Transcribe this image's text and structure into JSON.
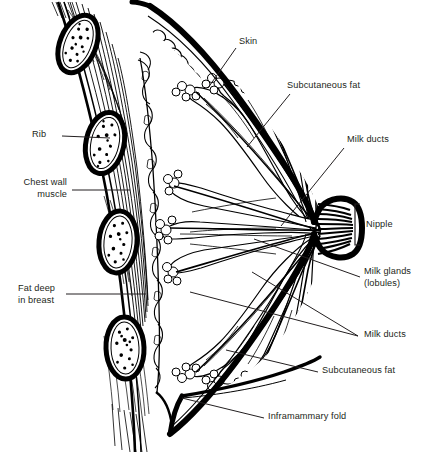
{
  "figure": {
    "type": "medical-illustration",
    "view": "sagittal section of female breast and chest wall",
    "style": "black-and-white line drawing",
    "width": 430,
    "height": 457,
    "ink_color": "#000000",
    "text_color": "#231f20",
    "background_color": "#ffffff"
  },
  "labels": {
    "skin": "Skin",
    "subcutaneous_fat_top": "Subcutaneous fat",
    "milk_ducts_top": "Milk ducts",
    "nipple": "Nipple",
    "milk_glands_line1": "Milk glands",
    "milk_glands_line2": "(lobules)",
    "milk_ducts_bottom": "Milk ducts",
    "subcutaneous_fat_bottom": "Subcutaneous fat",
    "inframammary_fold": "Inframammary fold",
    "rib": "Rib",
    "chest_wall_line1": "Chest wall",
    "chest_wall_line2": "muscle",
    "fat_deep_line1": "Fat deep",
    "fat_deep_line2": "in breast"
  },
  "structures": [
    {
      "name": "skin",
      "side": "right",
      "description": "thick outer contour of the breast"
    },
    {
      "name": "subcutaneous-fat",
      "side": "right",
      "description": "lobulated fat layer beneath the skin"
    },
    {
      "name": "milk-ducts",
      "side": "right",
      "description": "channels converging toward the nipple"
    },
    {
      "name": "nipple",
      "side": "right",
      "description": "duct outlet at the breast apex"
    },
    {
      "name": "milk-glands-lobules",
      "side": "right",
      "description": "radiating glandular lobules"
    },
    {
      "name": "inframammary-fold",
      "side": "right",
      "description": "crease beneath the breast"
    },
    {
      "name": "rib",
      "side": "left",
      "description": "oval rib cross-sections with marrow"
    },
    {
      "name": "chest-wall-muscle",
      "side": "left",
      "description": "striated pectoral muscle layer"
    },
    {
      "name": "fat-deep-in-breast",
      "side": "left",
      "description": "retromammary fat between muscle and glands"
    }
  ]
}
